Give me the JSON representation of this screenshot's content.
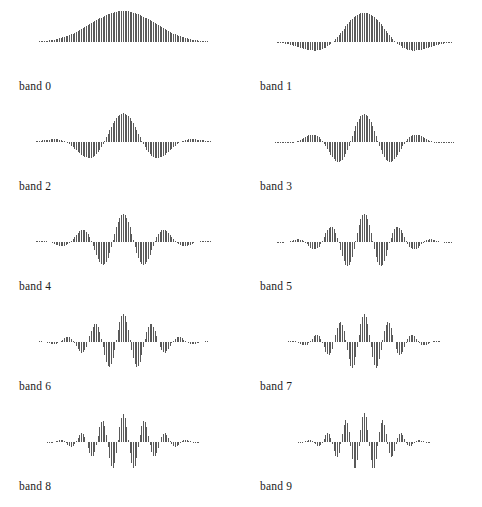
{
  "figure": {
    "type": "stem-plot-grid",
    "width": 482,
    "height": 507,
    "background": "#ffffff",
    "stem_color": "#595959",
    "columns": 2,
    "rows": 5
  },
  "chart_data": {
    "type": "line",
    "title": "",
    "subtitle": "",
    "xlabel": "",
    "ylabel": "",
    "grid": false,
    "legend_position": "none",
    "panel_type": "stem",
    "n_panels": 10,
    "n_samples": 128,
    "x": "sample index 0..127",
    "xlim": [
      0,
      127
    ],
    "ylim": [
      -1,
      1
    ],
    "series": [
      {
        "name": "band 0",
        "label": "band 0",
        "center": 64,
        "envelope_sigma": 22,
        "modulation_cycles": 0.55,
        "phase": 0.0,
        "amplitude": 1.0
      },
      {
        "name": "band 1",
        "label": "band 1",
        "center": 64,
        "envelope_sigma": 21,
        "modulation_cycles": 1.7,
        "phase": 0.0,
        "amplitude": 0.95
      },
      {
        "name": "band 2",
        "label": "band 2",
        "center": 64,
        "envelope_sigma": 20,
        "modulation_cycles": 2.8,
        "phase": 0.0,
        "amplitude": 0.92
      },
      {
        "name": "band 3",
        "label": "band 3",
        "center": 64,
        "envelope_sigma": 19.5,
        "modulation_cycles": 3.9,
        "phase": 0.0,
        "amplitude": 0.9
      },
      {
        "name": "band 4",
        "label": "band 4",
        "center": 64,
        "envelope_sigma": 19,
        "modulation_cycles": 5.1,
        "phase": 0.0,
        "amplitude": 0.9
      },
      {
        "name": "band 5",
        "label": "band 5",
        "center": 64,
        "envelope_sigma": 18.5,
        "modulation_cycles": 6.3,
        "phase": 0.0,
        "amplitude": 0.9
      },
      {
        "name": "band 6",
        "label": "band 6",
        "center": 64,
        "envelope_sigma": 18,
        "modulation_cycles": 7.6,
        "phase": 0.0,
        "amplitude": 0.9
      },
      {
        "name": "band 7",
        "label": "band 7",
        "center": 64,
        "envelope_sigma": 17.5,
        "modulation_cycles": 8.9,
        "phase": 0.0,
        "amplitude": 0.9
      },
      {
        "name": "band 8",
        "label": "band 8",
        "center": 64,
        "envelope_sigma": 16.5,
        "modulation_cycles": 10.2,
        "phase": 0.0,
        "amplitude": 0.9
      },
      {
        "name": "band 9",
        "label": "band 9",
        "center": 64,
        "envelope_sigma": 14,
        "modulation_cycles": 11.6,
        "phase": 0.0,
        "amplitude": 0.95
      }
    ]
  },
  "panels": [
    {
      "label": "band 0",
      "col": 0,
      "row": 0
    },
    {
      "label": "band 1",
      "col": 1,
      "row": 0
    },
    {
      "label": "band 2",
      "col": 0,
      "row": 1
    },
    {
      "label": "band 3",
      "col": 1,
      "row": 1
    },
    {
      "label": "band 4",
      "col": 0,
      "row": 2
    },
    {
      "label": "band 5",
      "col": 1,
      "row": 2
    },
    {
      "label": "band 6",
      "col": 0,
      "row": 3
    },
    {
      "label": "band 7",
      "col": 1,
      "row": 3
    },
    {
      "label": "band 8",
      "col": 0,
      "row": 4
    },
    {
      "label": "band 9",
      "col": 1,
      "row": 4
    }
  ]
}
